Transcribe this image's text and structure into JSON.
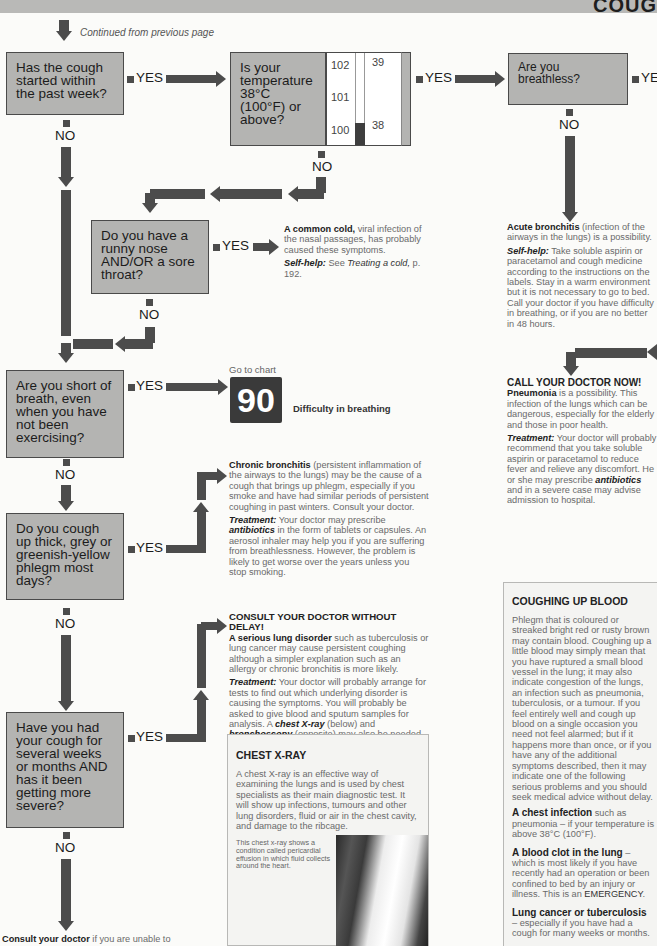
{
  "header": {
    "title": "COUG"
  },
  "continued": "Continued from previous page",
  "questions": {
    "q1": "Has the cough started within the past week?",
    "q2": "Is your temperature 38°C (100°F) or above?",
    "q3": "Are you breathless?",
    "q4": "Do you have a runny nose AND/OR a sore throat?",
    "q5": "Are you short of breath, even when you have not been exercising?",
    "q6": "Do you cough up thick, grey or greenish-yellow phlegm most days?",
    "q7": "Have you had your cough for several weeks or months AND has it been getting more severe?"
  },
  "labels": {
    "yes": "YES",
    "no": "NO",
    "yes_cut": "YE"
  },
  "gauge": {
    "f_ticks": [
      "102",
      "101",
      "100"
    ],
    "c_ticks": [
      "39",
      "38"
    ]
  },
  "common_cold": {
    "title": "A common cold,",
    "body": " viral infection of the nasal passages, has probably caused these symptoms.",
    "selfhelp_label": "Self-help:",
    "selfhelp_pre": " See ",
    "selfhelp_link": "Treating a cold,",
    "selfhelp_post": " p. 192."
  },
  "chart_ref": {
    "goto": "Go to chart",
    "number": "90",
    "title": "Difficulty in breathing"
  },
  "acute_bronchitis": {
    "title": "Acute bronchitis",
    "body": " (infection of the airways in the lungs) is a possibility.",
    "selfhelp_label": "Self-help:",
    "selfhelp": " Take soluble aspirin or paracetamol and cough medicine according to the instructions on the labels. Stay in a warm environment but it is not necessary to go to bed. Call your doctor if you have difficulty in breathing, or if you are no better in 48 hours."
  },
  "pneumonia": {
    "heading": "CALL YOUR DOCTOR NOW!",
    "title": "Pneumonia",
    "body": " is a possibility. This infection of the lungs which can be dangerous, especially for the elderly and those in poor health.",
    "treatment_label": "Treatment:",
    "treatment_pre": " Your doctor will probably recommend that you take soluble aspirin or paracetamol to reduce fever and relieve any discomfort. He or she may prescribe ",
    "treatment_link": "antibiotics",
    "treatment_post": " and in a severe case may advise admission to hospital."
  },
  "chronic_bronchitis": {
    "title": "Chronic bronchitis",
    "body": " (persistent inflammation of the airways to the lungs) may be the cause of a cough that brings up phlegm, especially if you smoke and have had similar periods of persistent coughing in past winters. Consult your doctor.",
    "treatment_label": "Treatment:",
    "treatment_pre": " Your doctor may prescribe ",
    "treatment_link": "antibiotics",
    "treatment_post": " in the form of tablets or capsules. An aerosol inhaler may help you if you are suffering from breathlessness. However, the problem is likely to get worse over the years unless you stop smoking."
  },
  "serious": {
    "heading": "CONSULT YOUR DOCTOR WITHOUT DELAY!",
    "title": "A serious lung disorder",
    "body": " such as tuberculosis or lung cancer may cause persistent coughing although a simpler explanation such as an allergy or chronic bronchitis is more likely.",
    "treatment_label": "Treatment:",
    "treatment_pre": " Your doctor will probably arrange for tests to find out which underlying disorder is causing the symptoms. You will probably be asked to give blood and sputum samples for analysis. A ",
    "link1": "chest X-ray",
    "mid": " (below) and ",
    "link2": "bronchoscopy",
    "treatment_post": " (opposite) may also be needed."
  },
  "chest_xray": {
    "heading": "CHEST X-RAY",
    "body": "A chest X-ray is an effective way of examining the lungs and is used by chest specialists as their main diagnostic test. It will show up infections, tumours and other lung disorders, fluid or air in the chest cavity, and damage to the ribcage.",
    "caption": "This chest x-ray shows a condition called pericardial effusion in which fluid collects around the heart."
  },
  "blood": {
    "heading": "COUGHING UP BLOOD",
    "body": "Phlegm that is coloured or streaked bright red or rusty brown may contain blood. Coughing up a little blood may simply mean that you have ruptured a small blood vessel in the lung; it may also indicate congestion of the lungs, an infection such as pneumonia, tuberculosis, or a tumour. If you feel entirely well and cough up blood on a single occasion you need not feel alarmed; but if it happens more than once, or if you have any of the additional symptoms described, then it may indicate one of the following serious problems and you should seek medical advice without delay.",
    "item1_title": "A chest infection",
    "item1_body": " such as pneumonia – if your temperature is above 38°C (100°F).",
    "item2_title": "A blood clot in the lung",
    "item2_body": " – which is most likely if you have recently had an operation or been confined to bed by an injury or illness. This is an ",
    "item2_emph": "EMERGENCY",
    "item2_end": ".",
    "item3_title": "Lung cancer or tuberculosis",
    "item3_body": " – especially if you have had a cough for many weeks or months."
  },
  "consult": {
    "title": "Consult your doctor",
    "body": " if you are unable to"
  }
}
